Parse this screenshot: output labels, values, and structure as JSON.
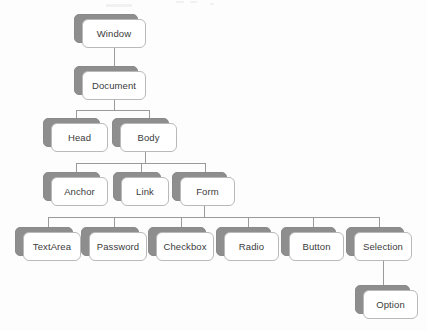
{
  "diagram": {
    "type": "hierarchy-tree",
    "colors": {
      "page_background": "#fdfdfd",
      "card_front_fill": "#ffffff",
      "card_front_border": "#b9b9b9",
      "card_back_fill": "#8e8e8e",
      "connector_line": "#9a9a9a",
      "label_text": "#3b3b3b"
    },
    "nodes": [
      {
        "id": "window",
        "label": "Window",
        "level": 0,
        "x": 74,
        "y": 14,
        "w": 64,
        "h": 29
      },
      {
        "id": "document",
        "label": "Document",
        "level": 1,
        "x": 74,
        "y": 66,
        "w": 64,
        "h": 29
      },
      {
        "id": "head",
        "label": "Head",
        "level": 2,
        "x": 43,
        "y": 118,
        "w": 57,
        "h": 29
      },
      {
        "id": "body",
        "label": "Body",
        "level": 2,
        "x": 112,
        "y": 118,
        "w": 57,
        "h": 29
      },
      {
        "id": "anchor",
        "label": "Anchor",
        "level": 3,
        "x": 43,
        "y": 172,
        "w": 57,
        "h": 29
      },
      {
        "id": "link",
        "label": "Link",
        "level": 3,
        "x": 113,
        "y": 172,
        "w": 48,
        "h": 29
      },
      {
        "id": "form",
        "label": "Form",
        "level": 3,
        "x": 172,
        "y": 172,
        "w": 55,
        "h": 29
      },
      {
        "id": "textarea",
        "label": "TextArea",
        "level": 4,
        "x": 15,
        "y": 227,
        "w": 58,
        "h": 29
      },
      {
        "id": "password",
        "label": "Password",
        "level": 4,
        "x": 81,
        "y": 227,
        "w": 58,
        "h": 29
      },
      {
        "id": "checkbox",
        "label": "Checkbox",
        "level": 4,
        "x": 148,
        "y": 227,
        "w": 58,
        "h": 29
      },
      {
        "id": "radio",
        "label": "Radio",
        "level": 4,
        "x": 216,
        "y": 227,
        "w": 55,
        "h": 29
      },
      {
        "id": "button",
        "label": "Button",
        "level": 4,
        "x": 281,
        "y": 227,
        "w": 55,
        "h": 29
      },
      {
        "id": "selection",
        "label": "Selection",
        "level": 4,
        "x": 346,
        "y": 227,
        "w": 58,
        "h": 29
      },
      {
        "id": "option",
        "label": "Option",
        "level": 5,
        "x": 355,
        "y": 285,
        "w": 55,
        "h": 29
      }
    ],
    "edges": [
      {
        "from": "window",
        "to": "document"
      },
      {
        "from": "document",
        "to": "head"
      },
      {
        "from": "document",
        "to": "body"
      },
      {
        "from": "body",
        "to": "anchor"
      },
      {
        "from": "body",
        "to": "link"
      },
      {
        "from": "body",
        "to": "form"
      },
      {
        "from": "form",
        "to": "textarea"
      },
      {
        "from": "form",
        "to": "password"
      },
      {
        "from": "form",
        "to": "checkbox"
      },
      {
        "from": "form",
        "to": "radio"
      },
      {
        "from": "form",
        "to": "button"
      },
      {
        "from": "form",
        "to": "selection"
      },
      {
        "from": "selection",
        "to": "option"
      }
    ]
  }
}
